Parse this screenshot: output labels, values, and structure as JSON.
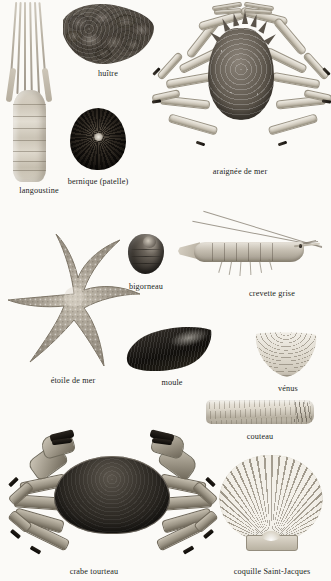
{
  "plate": {
    "title": "Crustacés et coquillages",
    "background_color": "#fbfaf7",
    "label_color": "#231f1d",
    "width": 331,
    "height": 581
  },
  "specimens": [
    {
      "id": "langoustine",
      "label": "langoustine",
      "label_x": 39,
      "label_y": 187,
      "row": 1
    },
    {
      "id": "huitre",
      "label": "huître",
      "label_x": 108,
      "label_y": 70,
      "row": 1
    },
    {
      "id": "bernique",
      "label": "bernique (patelle)",
      "label_x": 98,
      "label_y": 178,
      "row": 1
    },
    {
      "id": "araignee-de-mer",
      "label": "araignée de mer",
      "label_x": 240,
      "label_y": 168,
      "row": 1
    },
    {
      "id": "etoile-de-mer",
      "label": "étoile de mer",
      "label_x": 73,
      "label_y": 377,
      "row": 2
    },
    {
      "id": "bigorneau",
      "label": "bigorneau",
      "label_x": 146,
      "label_y": 283,
      "row": 2
    },
    {
      "id": "crevette-grise",
      "label": "crevette grise",
      "label_x": 272,
      "label_y": 290,
      "row": 2
    },
    {
      "id": "moule",
      "label": "moule",
      "label_x": 172,
      "label_y": 379,
      "row": 2
    },
    {
      "id": "venus",
      "label": "vénus",
      "label_x": 288,
      "label_y": 385,
      "row": 2
    },
    {
      "id": "couteau",
      "label": "couteau",
      "label_x": 260,
      "label_y": 433,
      "row": 3
    },
    {
      "id": "crabe-tourteau",
      "label": "crabe tourteau",
      "label_x": 94,
      "label_y": 568,
      "row": 3
    },
    {
      "id": "coquille-saint-jacques",
      "label": "coquille Saint-Jacques",
      "label_x": 272,
      "label_y": 568,
      "row": 3
    }
  ]
}
